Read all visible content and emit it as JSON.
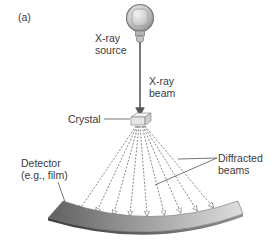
{
  "figure": {
    "panel_label": "(a)",
    "labels": {
      "source_line1": "X-ray",
      "source_line2": "source",
      "beam_line1": "X-ray",
      "beam_line2": "beam",
      "crystal": "Crystal",
      "detector_line1": "Detector",
      "detector_line2": "(e.g., film)",
      "diffracted_line1": "Diffracted",
      "diffracted_line2": "beams"
    },
    "colors": {
      "beam": "#555555",
      "detector_dark": "#6e6e6e",
      "detector_light": "#d9d9d9",
      "source_bulb": "#c8c8c8"
    },
    "diffracted_beam_count": 9
  }
}
